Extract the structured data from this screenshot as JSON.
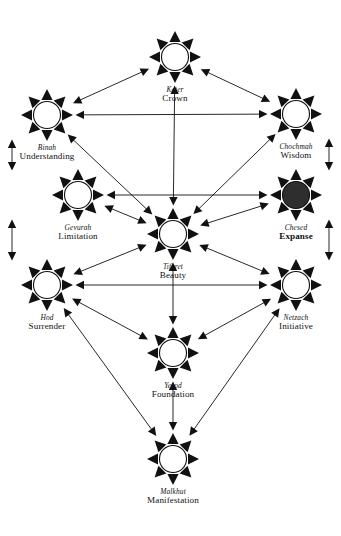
{
  "diagram": {
    "type": "node-link-diagram",
    "canvas": {
      "width": 341,
      "height": 536
    },
    "background_color": "#ffffff",
    "stroke_color": "#111111",
    "node_fill_default": "#ffffff",
    "node_fill_highlight": "#2e2e2e",
    "node_glyph": "sunburst-node",
    "node_radius": 13.5,
    "spike_count": 8,
    "spike_outer_radius": 26,
    "edge_style": "double-headed-arrow",
    "nodes": [
      {
        "id": "keter",
        "hebrew": "Keter",
        "english": "Crown",
        "cx": 175,
        "cy": 57,
        "label_y": 86,
        "filled": false,
        "bold_english": false
      },
      {
        "id": "binah",
        "hebrew": "Binah",
        "english": "Understanding",
        "cx": 47,
        "cy": 115,
        "label_y": 144,
        "filled": false,
        "bold_english": false
      },
      {
        "id": "chochmah",
        "hebrew": "Chochmah",
        "english": "Wisdom",
        "cx": 296,
        "cy": 114,
        "label_y": 143,
        "filled": false,
        "bold_english": false
      },
      {
        "id": "gevurah",
        "hebrew": "Gevurah",
        "english": "Limitation",
        "cx": 78,
        "cy": 195,
        "label_y": 224,
        "filled": false,
        "bold_english": false
      },
      {
        "id": "chesed",
        "hebrew": "Chesed",
        "english": "Expanse",
        "cx": 296,
        "cy": 195,
        "label_y": 224,
        "filled": true,
        "bold_english": true
      },
      {
        "id": "tiferet",
        "hebrew": "Tiferet",
        "english": "Beauty",
        "cx": 173,
        "cy": 234,
        "label_y": 263,
        "filled": false,
        "bold_english": false
      },
      {
        "id": "hod",
        "hebrew": "Hod",
        "english": "Surrender",
        "cx": 47,
        "cy": 285,
        "label_y": 314,
        "filled": false,
        "bold_english": false
      },
      {
        "id": "netzach",
        "hebrew": "Netzach",
        "english": "Initiative",
        "cx": 296,
        "cy": 285,
        "label_y": 314,
        "filled": false,
        "bold_english": false
      },
      {
        "id": "yesod",
        "hebrew": "Yesod",
        "english": "Foundation",
        "cx": 173,
        "cy": 353,
        "label_y": 382,
        "filled": false,
        "bold_english": false
      },
      {
        "id": "malkhut",
        "hebrew": "Malkhut",
        "english": "Manifestation",
        "cx": 173,
        "cy": 459,
        "label_y": 488,
        "filled": false,
        "bold_english": false
      }
    ],
    "edges": [
      {
        "from": "binah",
        "to": "keter",
        "arrows": "both",
        "shape": "straight"
      },
      {
        "from": "chochmah",
        "to": "keter",
        "arrows": "both",
        "shape": "straight"
      },
      {
        "from": "binah",
        "to": "chochmah",
        "arrows": "both",
        "shape": "straight"
      },
      {
        "from": "keter",
        "to": "tiferet",
        "arrows": "both",
        "shape": "straight"
      },
      {
        "from": "binah",
        "to": "tiferet",
        "arrows": "both",
        "shape": "straight"
      },
      {
        "from": "chochmah",
        "to": "tiferet",
        "arrows": "both",
        "shape": "straight"
      },
      {
        "from": "gevurah",
        "to": "chesed",
        "arrows": "both",
        "shape": "straight"
      },
      {
        "from": "gevurah",
        "to": "tiferet",
        "arrows": "both",
        "shape": "straight"
      },
      {
        "from": "chesed",
        "to": "tiferet",
        "arrows": "both",
        "shape": "straight"
      },
      {
        "from": "binah",
        "to": "gevurah",
        "arrows": "both",
        "shape": "outer-vertical-left"
      },
      {
        "from": "chochmah",
        "to": "chesed",
        "arrows": "both",
        "shape": "outer-vertical-right"
      },
      {
        "from": "gevurah",
        "to": "hod",
        "arrows": "both",
        "shape": "outer-vertical-left"
      },
      {
        "from": "chesed",
        "to": "netzach",
        "arrows": "both",
        "shape": "outer-vertical-right"
      },
      {
        "from": "hod",
        "to": "netzach",
        "arrows": "both",
        "shape": "straight"
      },
      {
        "from": "hod",
        "to": "tiferet",
        "arrows": "both",
        "shape": "straight"
      },
      {
        "from": "netzach",
        "to": "tiferet",
        "arrows": "both",
        "shape": "straight"
      },
      {
        "from": "tiferet",
        "to": "yesod",
        "arrows": "both",
        "shape": "straight"
      },
      {
        "from": "hod",
        "to": "yesod",
        "arrows": "both",
        "shape": "straight"
      },
      {
        "from": "netzach",
        "to": "yesod",
        "arrows": "both",
        "shape": "straight"
      },
      {
        "from": "hod",
        "to": "malkhut",
        "arrows": "both",
        "shape": "straight"
      },
      {
        "from": "netzach",
        "to": "malkhut",
        "arrows": "both",
        "shape": "straight"
      },
      {
        "from": "yesod",
        "to": "malkhut",
        "arrows": "both",
        "shape": "straight"
      }
    ]
  }
}
